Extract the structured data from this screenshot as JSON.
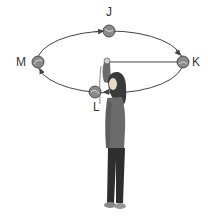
{
  "diagram": {
    "labels": {
      "J": "J",
      "K": "K",
      "L": "L",
      "M": "M"
    },
    "colors": {
      "ball": "#8a8a8a",
      "line": "#444444",
      "shirt": "#6b6b6b",
      "pants": "#2e2e2e",
      "hair": "#3a3a3a"
    }
  }
}
